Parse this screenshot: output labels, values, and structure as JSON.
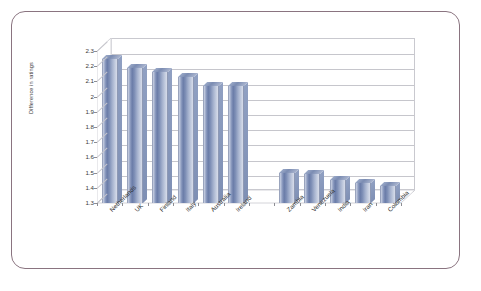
{
  "chart_data": {
    "type": "bar",
    "title": "",
    "subtitle": "",
    "xlabel": "",
    "ylabel": "Difference in ratings",
    "ylim": [
      1.3,
      2.3
    ],
    "ytick_labels": [
      "2.3",
      "2.2",
      "2.1",
      "2",
      "1.9",
      "1.8",
      "1.7",
      "1.6",
      "1.5",
      "1.4",
      "1.3"
    ],
    "ytick_values": [
      2.3,
      2.2,
      2.1,
      2.0,
      1.9,
      1.8,
      1.7,
      1.6,
      1.5,
      1.4,
      1.3
    ],
    "grid": true,
    "legend": "none",
    "style": "3d-column",
    "categories": [
      "Netherlands",
      "UK",
      "Finland",
      "Italy",
      "Australia",
      "Ireland",
      "",
      "Zambia",
      "Venezuela",
      "India",
      "Iran",
      "Colombia"
    ],
    "values": [
      2.25,
      2.19,
      2.16,
      2.13,
      2.07,
      2.07,
      null,
      1.5,
      1.49,
      1.45,
      1.43,
      1.41
    ],
    "points": [
      {
        "category": "Netherlands",
        "value": 2.25
      },
      {
        "category": "UK",
        "value": 2.19
      },
      {
        "category": "Finland",
        "value": 2.16
      },
      {
        "category": "Italy",
        "value": 2.13
      },
      {
        "category": "Australia",
        "value": 2.07
      },
      {
        "category": "Ireland",
        "value": 2.07
      },
      {
        "category": "",
        "value": null
      },
      {
        "category": "Zambia",
        "value": 1.5
      },
      {
        "category": "Venezuela",
        "value": 1.49
      },
      {
        "category": "India",
        "value": 1.45
      },
      {
        "category": "Iran",
        "value": 1.43
      },
      {
        "category": "Colombia",
        "value": 1.41
      }
    ],
    "colors": {
      "bar_light": "#ccd3e4",
      "bar_mid": "#6a7ca8",
      "bar_edge": "#8e99b4",
      "gridline": "#c6c6cc",
      "frame_border": "#8a7480",
      "text": "#2e2e2e"
    }
  }
}
